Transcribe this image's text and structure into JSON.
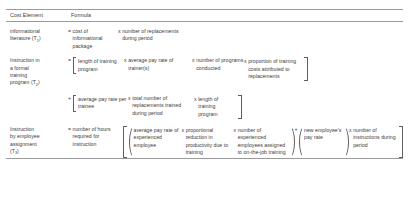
{
  "table": {
    "header": {
      "cost_element": "Cost Element",
      "formula": "Formula"
    },
    "rows": [
      {
        "label_line1": "informational",
        "label_line2": "literature (T",
        "label_sub": "1",
        "label_line3": ")",
        "terms": [
          {
            "op": "=",
            "text": "cost of informational package"
          },
          {
            "op": "x",
            "text": "number of replacements during period"
          }
        ]
      },
      {
        "label_line1": "Instruction in",
        "label_line2": "a formal",
        "label_line3": "training",
        "label_line4": "program (T",
        "label_sub": "2",
        "label_line5": ")",
        "terms": [
          {
            "op": "=",
            "text": "length of training program"
          },
          {
            "op": "x",
            "text": "average pay rate of trainer(s)"
          },
          {
            "op": "x",
            "text": "number of programs conducted"
          },
          {
            "op": "x",
            "text": "proportion of training costs attributed to replacements"
          }
        ],
        "continuation": {
          "op": "+",
          "terms": [
            {
              "op": "",
              "text": "average pay rate per trainee"
            },
            {
              "op": "x",
              "text": "total number of replacements trained during period"
            },
            {
              "op": "x",
              "text": "length of training program"
            }
          ]
        }
      },
      {
        "label_line1": "Instruction",
        "label_line2": "by employee",
        "label_line3": "assignment",
        "label_line4": "(T",
        "label_sub": "3",
        "label_line5": ")",
        "terms": [
          {
            "op": "=",
            "text": "number of hours required for instruction"
          }
        ],
        "bracket_groups": [
          {
            "op": "",
            "terms": [
              {
                "op": "",
                "text": "average pay rate of experienced employee"
              },
              {
                "op": "x",
                "text": "proportional reduction in productivity due to training"
              },
              {
                "op": "x",
                "text": "number of experienced employees assigned to on-the-job training"
              }
            ]
          },
          {
            "op": "+",
            "terms": [
              {
                "op": "",
                "text": "new employee's pay rate"
              }
            ]
          }
        ],
        "trailing_term": {
          "op": "x",
          "text": "number of instructions during period"
        }
      }
    ]
  },
  "colors": {
    "rule": "#9a9a9a",
    "bracket": "#5f5f5f",
    "text": "#3c3c3c",
    "background": "#ffffff"
  }
}
